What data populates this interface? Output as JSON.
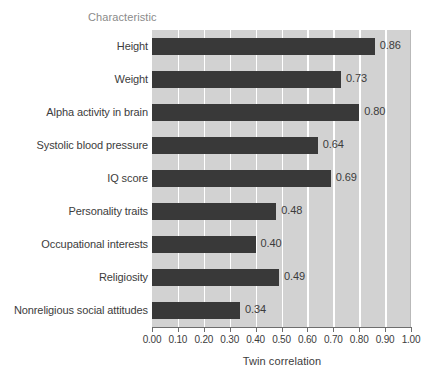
{
  "chart_data": {
    "type": "bar",
    "orientation": "horizontal",
    "title": "",
    "xlabel": "Twin correlation",
    "ylabel": "Characteristic",
    "xlim": [
      0.0,
      1.0
    ],
    "xticks": [
      "0.00",
      "0.10",
      "0.20",
      "0.30",
      "0.40",
      "0.50",
      "0.60",
      "0.70",
      "0.80",
      "0.90",
      "1.00"
    ],
    "grid": "vertical-white-gridlines",
    "legend": "none",
    "categories": [
      "Height",
      "Weight",
      "Alpha activity in brain",
      "Systolic blood pressure",
      "IQ score",
      "Personality traits",
      "Occupational interests",
      "Religiosity",
      "Nonreligious social attitudes"
    ],
    "values": [
      0.86,
      0.73,
      0.8,
      0.64,
      0.69,
      0.48,
      0.4,
      0.49,
      0.34
    ],
    "value_labels": [
      "0.86",
      "0.73",
      "0.80",
      "0.64",
      "0.69",
      "0.48",
      "0.40",
      "0.49",
      "0.34"
    ],
    "colors": {
      "bar": "#393939",
      "plot_background": "#d2d2d2",
      "gridline": "#ffffff",
      "figure_background": "#ffffff",
      "text": "#3c3c3c",
      "axis_header_text": "#8a8a8a"
    }
  }
}
